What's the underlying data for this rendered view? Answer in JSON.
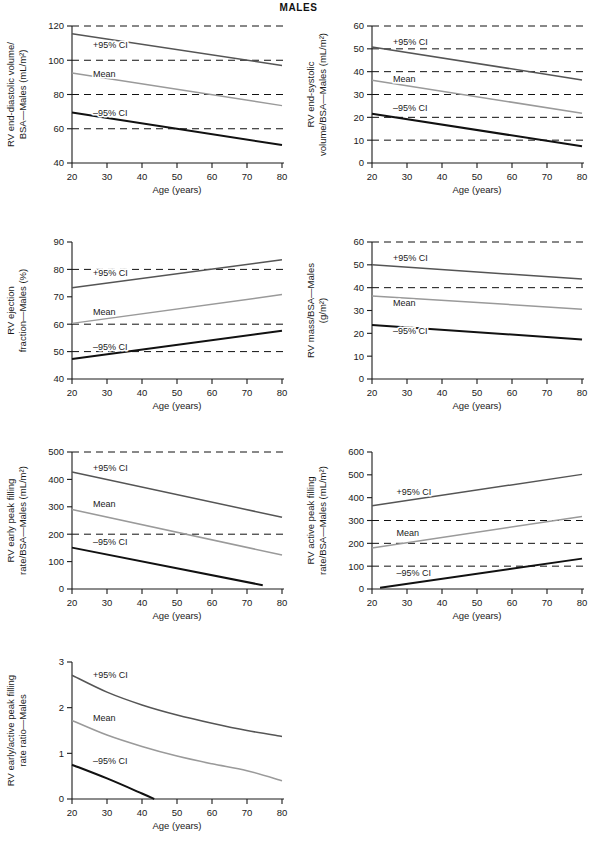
{
  "figure": {
    "title": "MALES",
    "xlabel": "Age (years)",
    "series_labels": {
      "upper": "+95% CI",
      "mean": "Mean",
      "lower": "–95% CI"
    },
    "colors": {
      "upper": "#555555",
      "mean": "#9a9a9a",
      "lower": "#111111",
      "axis": "#1a1a1a",
      "grid": "#111111"
    }
  },
  "chart_data": [
    {
      "id": "rv-edv-bsa",
      "type": "line",
      "title": "",
      "xlabel": "Age (years)",
      "ylabel": "RV end-diastolic volume/\nBSA—Males (mL/m²)",
      "ylabel_lines": [
        "RV end-diastolic volume/",
        "BSA—Males (mL/m²)"
      ],
      "xlim": [
        20,
        80
      ],
      "ylim": [
        40,
        120
      ],
      "xticks": [
        20,
        30,
        40,
        50,
        60,
        70,
        80
      ],
      "yticks": [
        40,
        60,
        80,
        100,
        120
      ],
      "gridlines_y": [
        60,
        80,
        100,
        120
      ],
      "grid": true,
      "legend": "inline-annotations",
      "x": [
        20,
        80
      ],
      "series": [
        {
          "name": "+95% CI",
          "values": [
            115.5,
            97.0
          ]
        },
        {
          "name": "Mean",
          "values": [
            92.5,
            73.5
          ]
        },
        {
          "name": "–95% CI",
          "values": [
            69.5,
            50.5
          ]
        }
      ]
    },
    {
      "id": "rv-esv-bsa",
      "type": "line",
      "xlabel": "Age (years)",
      "ylabel_lines": [
        "RV end-systolic",
        "volume/BSA—Males (mL/m²)"
      ],
      "xlim": [
        20,
        80
      ],
      "ylim": [
        0,
        60
      ],
      "xticks": [
        20,
        30,
        40,
        50,
        60,
        70,
        80
      ],
      "yticks": [
        0,
        10,
        20,
        30,
        40,
        50,
        60
      ],
      "gridlines_y": [
        10,
        20,
        30,
        40,
        50,
        60
      ],
      "grid": true,
      "x": [
        20,
        80
      ],
      "series": [
        {
          "name": "+95% CI",
          "values": [
            50.8,
            36.4
          ]
        },
        {
          "name": "Mean",
          "values": [
            36.2,
            21.8
          ]
        },
        {
          "name": "–95% CI",
          "values": [
            21.6,
            7.3
          ]
        }
      ]
    },
    {
      "id": "rv-ejection-fraction",
      "type": "line",
      "xlabel": "Age (years)",
      "ylabel_lines": [
        "RV ejection",
        "fraction—Males (%)"
      ],
      "xlim": [
        20,
        80
      ],
      "ylim": [
        40,
        90
      ],
      "xticks": [
        20,
        30,
        40,
        50,
        60,
        70,
        80
      ],
      "yticks": [
        40,
        50,
        60,
        70,
        80,
        90
      ],
      "gridlines_y": [
        50,
        60,
        80
      ],
      "grid": true,
      "x": [
        20,
        80
      ],
      "series": [
        {
          "name": "+95% CI",
          "values": [
            73.3,
            83.5
          ]
        },
        {
          "name": "Mean",
          "values": [
            60.3,
            70.8
          ]
        },
        {
          "name": "–95% CI",
          "values": [
            47.3,
            57.6
          ]
        }
      ]
    },
    {
      "id": "rv-mass-bsa",
      "type": "line",
      "xlabel": "Age (years)",
      "ylabel_lines": [
        "RV mass/BSA—Males",
        "(g/m²)"
      ],
      "xlim": [
        20,
        80
      ],
      "ylim": [
        0,
        60
      ],
      "xticks": [
        20,
        30,
        40,
        50,
        60,
        70,
        80
      ],
      "yticks": [
        0,
        10,
        20,
        30,
        40,
        50,
        60
      ],
      "gridlines_y": [
        40,
        60
      ],
      "grid": true,
      "x": [
        20,
        80
      ],
      "series": [
        {
          "name": "+95% CI",
          "values": [
            50.0,
            43.8
          ]
        },
        {
          "name": "Mean",
          "values": [
            36.4,
            30.6
          ]
        },
        {
          "name": "–95% CI",
          "values": [
            23.7,
            17.3
          ]
        }
      ]
    },
    {
      "id": "rv-early-peak-filling-rate",
      "type": "line",
      "xlabel": "Age (years)",
      "ylabel_lines": [
        "RV early peak filling",
        "rate/BSA—Males (mL/m²)"
      ],
      "xlim": [
        20,
        80
      ],
      "ylim": [
        0,
        500
      ],
      "xticks": [
        20,
        30,
        40,
        50,
        60,
        70,
        80
      ],
      "yticks": [
        0,
        100,
        200,
        300,
        400,
        500
      ],
      "gridlines_y": [
        200,
        500
      ],
      "grid": true,
      "x": [
        20,
        80
      ],
      "series": [
        {
          "name": "+95% CI",
          "values": [
            427,
            262
          ]
        },
        {
          "name": "Mean",
          "values": [
            290,
            124
          ]
        },
        {
          "name": "–95% CI",
          "values": [
            151,
            0
          ],
          "x_end_clip": 74.5
        }
      ]
    },
    {
      "id": "rv-active-peak-filling-rate",
      "type": "line",
      "xlabel": "Age (years)",
      "ylabel_lines": [
        "RV active peak filling",
        "rate/BSA—Males (mL/m²)"
      ],
      "xlim": [
        20,
        80
      ],
      "ylim": [
        0,
        600
      ],
      "xticks": [
        20,
        30,
        40,
        50,
        60,
        70,
        80
      ],
      "yticks": [
        0,
        100,
        200,
        300,
        400,
        500,
        600
      ],
      "gridlines_y": [
        100,
        200,
        300
      ],
      "grid": true,
      "x": [
        20,
        80
      ],
      "series": [
        {
          "name": "+95% CI",
          "values": [
            365,
            502
          ]
        },
        {
          "name": "Mean",
          "values": [
            180,
            318
          ]
        },
        {
          "name": "–95% CI",
          "values": [
            0,
            133
          ],
          "x_start_clip": 22.3
        }
      ]
    },
    {
      "id": "rv-early-active-ratio",
      "type": "line",
      "xlabel": "Age (years)",
      "ylabel_lines": [
        "RV early/active peak filling",
        "rate ratio—Males"
      ],
      "xlim": [
        20,
        80
      ],
      "ylim": [
        0,
        3
      ],
      "xticks": [
        20,
        30,
        40,
        50,
        60,
        70,
        80
      ],
      "yticks": [
        0,
        1,
        2,
        3
      ],
      "gridlines_y": [],
      "grid": false,
      "curve": "decay",
      "x": [
        20,
        30,
        40,
        50,
        60,
        70,
        80
      ],
      "series": [
        {
          "name": "+95% CI",
          "values": [
            2.71,
            2.34,
            2.06,
            1.84,
            1.66,
            1.5,
            1.37
          ]
        },
        {
          "name": "Mean",
          "values": [
            1.72,
            1.4,
            1.15,
            0.94,
            0.77,
            0.62,
            0.4
          ]
        },
        {
          "name": "–95% CI",
          "values": [
            0.75,
            0.45,
            0.12,
            0,
            0,
            0,
            0
          ],
          "x_end_clip": 43.5
        }
      ]
    }
  ]
}
